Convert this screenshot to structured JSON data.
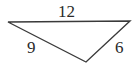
{
  "diagram": {
    "type": "triangle",
    "stroke_color": "#3a3a3a",
    "vertices": {
      "left": [
        8,
        22
      ],
      "right": [
        130,
        21
      ],
      "bottom": [
        86,
        62
      ]
    },
    "sides": [
      {
        "name": "top",
        "label": "12"
      },
      {
        "name": "left",
        "label": "9"
      },
      {
        "name": "right",
        "label": "6"
      }
    ]
  }
}
